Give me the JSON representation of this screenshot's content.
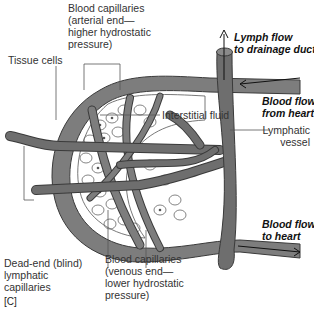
{
  "figure": {
    "panel_tag": "[C]",
    "colors": {
      "vessel_fill": "#7a7a7a",
      "vessel_stroke": "#3a3a3a",
      "lymph_fill": "#6e6e6e",
      "tissue_fill": "#ffffff",
      "cell_stroke": "#555555",
      "leader_line": "#555555",
      "text": "#333333"
    }
  },
  "labels": {
    "blood_cap_arterial": "Blood capillaries\n(arterial end—\nhigher hydrostatic\npressure)",
    "tissue_cells": "Tissue cells",
    "interstitial_fluid": "Interstitial fluid",
    "lymph_flow": "Lymph flow\nto drainage ducts",
    "blood_from_heart": "Blood flow\nfrom heart",
    "lymphatic_vessel": "Lymphatic\nvessel",
    "blood_to_heart": "Blood flow\nto heart",
    "dead_end": "Dead-end (blind)\nlymphatic\ncapillaries",
    "blood_cap_venous": "Blood capillaries\n(venous end—\nlower hydrostatic\npressure)"
  }
}
